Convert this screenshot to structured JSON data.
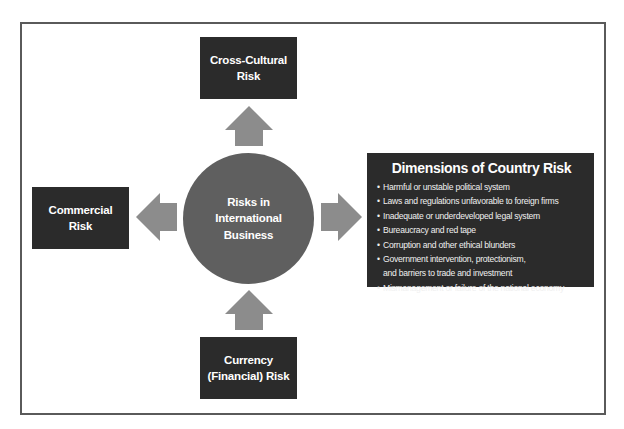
{
  "diagram": {
    "center": {
      "lines": [
        "Risks in",
        "International",
        "Business"
      ]
    },
    "top_box": {
      "lines": [
        "Cross-Cultural",
        "Risk"
      ]
    },
    "left_box": {
      "lines": [
        "Commercial",
        "Risk"
      ]
    },
    "bottom_box": {
      "lines": [
        "Currency",
        "(Financial) Risk"
      ]
    },
    "right_box": {
      "title": "Dimensions of Country Risk",
      "items": [
        {
          "lines": [
            "Harmful or unstable political system"
          ]
        },
        {
          "lines": [
            "Laws and regulations unfavorable to foreign firms"
          ]
        },
        {
          "lines": [
            "Inadequate or underdeveloped legal system"
          ]
        },
        {
          "lines": [
            "Bureaucracy and red tape"
          ]
        },
        {
          "lines": [
            "Corruption and other ethical blunders"
          ]
        },
        {
          "lines": [
            "Government intervention, protectionism,",
            "and barriers to trade and investment"
          ]
        },
        {
          "lines": [
            "Mismanagement or failure of the national economy"
          ]
        }
      ]
    },
    "arrows": {
      "up": "arrow-up-icon",
      "down": "arrow-up-icon",
      "left": "arrow-left-icon",
      "right": "arrow-right-icon"
    },
    "colors": {
      "box_fill": "#2b2b2b",
      "circle_fill": "#5f5f5f",
      "arrow_fill": "#8c8c8c",
      "frame_border": "#5a5a5a",
      "text": "#ffffff"
    }
  }
}
